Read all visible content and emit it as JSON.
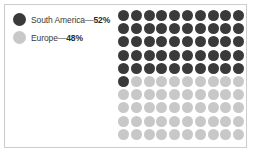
{
  "chart_data": {
    "type": "pie",
    "title": "",
    "subtitle": "",
    "xlabel": "",
    "ylabel": "",
    "display": "waffle-dot-grid",
    "grid_rows": 10,
    "grid_cols": 10,
    "total_units": 100,
    "fill_order": "row-major-left-to-right-top-to-bottom",
    "categories": [
      "South America",
      "Europe"
    ],
    "values": [
      52,
      48
    ],
    "units": "percent",
    "dark_units_rendered": 51,
    "light_units_rendered": 49,
    "legend_position": "left",
    "grid": false,
    "colors": {
      "south_america": "#3a3a3a",
      "europe": "#c8c8c8",
      "background": "#ffffff",
      "frame_border": "#cccccc",
      "text": "#3a3a3a"
    }
  },
  "legend": {
    "items": [
      {
        "label": "South America",
        "separator": "—",
        "value": "52%",
        "color": "#3a3a3a",
        "swatch_name": "legend-swatch-south-america"
      },
      {
        "label": "Europe",
        "separator": "—",
        "value": "48%",
        "color": "#c8c8c8",
        "swatch_name": "legend-swatch-europe"
      }
    ]
  }
}
